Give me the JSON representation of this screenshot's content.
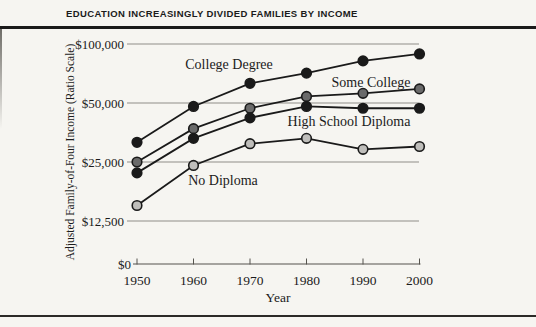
{
  "page": {
    "title": "EDUCATION INCREASINGLY DIVIDED FAMILIES BY INCOME"
  },
  "chart_data": {
    "type": "line",
    "title": "EDUCATION INCREASINGLY DIVIDED FAMILIES BY INCOME",
    "xlabel": "Year",
    "ylabel": "Adjusted Family-of-Four Income (Ratio Scale)",
    "x": [
      1950,
      1960,
      1970,
      1980,
      1990,
      2000
    ],
    "y_scale": "log (ratio scale, doublings equally spaced)",
    "grid": "horizontal gridlines at labeled dollar ticks",
    "legend": "direct labels placed next to each line",
    "y_ticks": [
      {
        "label": "$100,000",
        "value": 100000
      },
      {
        "label": "$50,000",
        "value": 50000
      },
      {
        "label": "$25,000",
        "value": 25000
      },
      {
        "label": "$12,500",
        "value": 12500
      },
      {
        "label": "$0",
        "value": 0
      }
    ],
    "series": [
      {
        "name": "College Degree",
        "marker_fill": "#1a1a1a",
        "values": [
          31500,
          48000,
          63000,
          71000,
          82000,
          89000
        ],
        "label_x": 229,
        "label_y": 69
      },
      {
        "name": "Some College",
        "marker_fill": "#6a6a6a",
        "values": [
          25000,
          37000,
          47000,
          54000,
          56000,
          59000
        ],
        "label_x": 371,
        "label_y": 87
      },
      {
        "name": "High School Diploma",
        "marker_fill": "#1a1a1a",
        "values": [
          22000,
          33000,
          42000,
          48000,
          47000,
          47000
        ],
        "label_x": 349,
        "label_y": 126
      },
      {
        "name": "No Diploma",
        "marker_fill": "#bfbebb",
        "values": [
          15000,
          24000,
          31000,
          33000,
          29000,
          30000
        ],
        "label_x": 223,
        "label_y": 185
      }
    ],
    "line_color": "#1a1a1a"
  },
  "colors": {
    "background": "#f6f5f1",
    "gridline": "#8f8d88",
    "axis": "#55534e",
    "text": "#1b1b1b",
    "rule": "#1a1a1a"
  }
}
